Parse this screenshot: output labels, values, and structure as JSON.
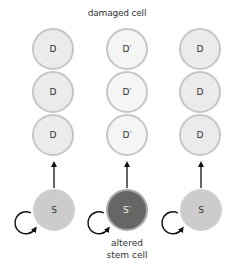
{
  "title": "damaged cell",
  "columns": [
    {
      "differentiated": [
        "D",
        "D",
        "D"
      ],
      "stem": "S",
      "variant": "normal"
    },
    {
      "differentiated": [
        "D′",
        "D′",
        "D′"
      ],
      "stem": "S′",
      "variant": "altered"
    },
    {
      "differentiated": [
        "D",
        "D",
        "D"
      ],
      "stem": "S",
      "variant": "normal"
    }
  ],
  "caption": {
    "line1": "altered",
    "line2": "stem cell"
  },
  "colors": {
    "differentiated_fill": "#ebebeb",
    "damaged_fill": "#f5f5f5",
    "stem_fill": "#cccccc",
    "altered_stem_fill": "#666666",
    "outline": "#c6c6c6",
    "arrow": "#111111"
  }
}
